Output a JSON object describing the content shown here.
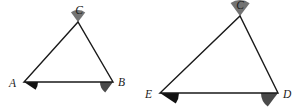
{
  "figure": {
    "background_color": "#ffffff",
    "stroke_color": "#1a1a1a",
    "label_color": "#1a1a1a",
    "stroke_width": 1.4
  },
  "shapes": [
    {
      "id": "triangle-abc",
      "name": "triangle-abc",
      "vertices": [
        {
          "label": "A",
          "x": 24,
          "y": 82
        },
        {
          "label": "B",
          "x": 113,
          "y": 82
        },
        {
          "label": "C",
          "x": 78,
          "y": 22
        }
      ],
      "labels": [
        {
          "for": "A",
          "text": "A",
          "x": 9,
          "y": 87
        },
        {
          "for": "B",
          "text": "B",
          "x": 118,
          "y": 86
        },
        {
          "for": "C",
          "text": "C",
          "x": 79,
          "y": 14
        }
      ],
      "angles": [
        {
          "at": "A",
          "name": "angle-a",
          "fill": "#111111",
          "radius": 14,
          "start_deg": 0,
          "end_deg": 34
        },
        {
          "at": "B",
          "name": "angle-b",
          "fill": "#4a4a4a",
          "radius": 13,
          "start_deg": 127,
          "end_deg": 180
        },
        {
          "at": "C",
          "name": "angle-c-left",
          "fill": "#737373",
          "radius": 12,
          "start_deg": 234,
          "end_deg": 307
        }
      ]
    },
    {
      "id": "triangle-ecd",
      "name": "triangle-ecd",
      "vertices": [
        {
          "label": "E",
          "x": 160,
          "y": 93
        },
        {
          "label": "D",
          "x": 278,
          "y": 93
        },
        {
          "label": "C",
          "x": 240,
          "y": 16
        }
      ],
      "labels": [
        {
          "for": "E",
          "text": "E",
          "x": 145,
          "y": 98
        },
        {
          "for": "D",
          "text": "D",
          "x": 283,
          "y": 98
        },
        {
          "for": "C",
          "text": "C",
          "x": 240,
          "y": 9
        }
      ],
      "angles": [
        {
          "at": "E",
          "name": "angle-e",
          "fill": "#111111",
          "radius": 19,
          "start_deg": 0,
          "end_deg": 34
        },
        {
          "at": "D",
          "name": "angle-d",
          "fill": "#4a4a4a",
          "radius": 17,
          "start_deg": 127,
          "end_deg": 180
        },
        {
          "at": "C",
          "name": "angle-c-right",
          "fill": "#737373",
          "radius": 16,
          "start_deg": 234,
          "end_deg": 307
        }
      ]
    }
  ]
}
